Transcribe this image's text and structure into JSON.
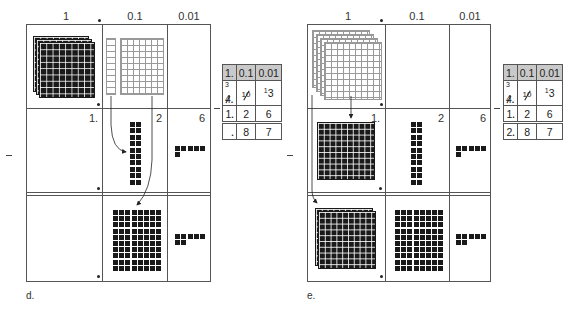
{
  "figure": {
    "type": "decimal-subtraction-base-ten-blocks",
    "column_headers": [
      "1",
      ".",
      "0.1",
      "0.01"
    ],
    "panels": [
      {
        "id": "d",
        "caption": "d.",
        "rows": [
          {
            "ones": "4 flats (3 dark stacked + regrouping)",
            "tenths": "1 rod + 10×10 outlined (regrouped)",
            "hundredths": ""
          },
          {
            "ones_label": "1.",
            "tenths_label": "2",
            "hundredths_label": "6",
            "tenths_blocks": "2×10",
            "hundredths_blocks": 6
          },
          {
            "ones_label": "",
            "tenths_blocks": "8×10",
            "hundredths_blocks": 7
          }
        ],
        "table": {
          "header": [
            "1.",
            "0.1",
            "0.01"
          ],
          "rows": [
            {
              "ones_sup": "3",
              "ones": "4",
              "ones_crossed": true,
              "dot": ".",
              "tenths_sup": "10",
              "tenths_crossed": true,
              "hundredths_sup": "1",
              "hundredths": "3"
            },
            {
              "ones": "1",
              "dot": ".",
              "tenths": "2",
              "hundredths": "6"
            },
            {
              "ones": "",
              "dot": ".",
              "tenths": "8",
              "hundredths": "7"
            }
          ]
        }
      },
      {
        "id": "e",
        "caption": "e.",
        "rows": [
          {
            "ones": "outlined flats (regrouped)",
            "tenths": "",
            "hundredths": ""
          },
          {
            "ones_label": "1.",
            "tenths_label": "2",
            "hundredths_label": "6",
            "ones_blocks": "10×10 flat",
            "tenths_blocks": "2×10",
            "hundredths_blocks": 6
          },
          {
            "ones_blocks": "2 stacked flats",
            "tenths_blocks": "8×10",
            "hundredths_blocks": 7
          }
        ],
        "table": {
          "header": [
            "1.",
            "0.1",
            "0.01"
          ],
          "rows": [
            {
              "ones_sup": "3",
              "ones": "4",
              "ones_crossed": true,
              "dot": ".",
              "tenths_sup": "10",
              "tenths_crossed": true,
              "hundredths_sup": "1",
              "hundredths": "3"
            },
            {
              "ones": "1",
              "dot": ".",
              "tenths": "2",
              "hundredths": "6"
            },
            {
              "ones": "2",
              "dot": ".",
              "tenths": "8",
              "hundredths": "7"
            }
          ]
        }
      }
    ],
    "minus_sign": "−"
  },
  "labels": {
    "d": {
      "col1": "1",
      "col2": "0.1",
      "col3": "0.01",
      "r2_ones": "1.",
      "r2_tenths": "2",
      "r2_hund": "6",
      "caption": "d."
    },
    "e": {
      "col1": "1",
      "col2": "0.1",
      "col3": "0.01",
      "r2_ones": "1.",
      "r2_tenths": "2",
      "r2_hund": "6",
      "caption": "e."
    }
  },
  "tables": {
    "d": {
      "h1": "1.",
      "h2": "0.1",
      "h3": "0.01",
      "r1_sup": "3",
      "r1_ones": "4",
      "r1_tsup": "10",
      "r1_hsup": "1",
      "r1_h": "3",
      "r2_o": "1",
      "r2_t": "2",
      "r2_h": "6",
      "r3_o": "",
      "r3_t": "8",
      "r3_h": "7"
    },
    "e": {
      "h1": "1.",
      "h2": "0.1",
      "h3": "0.01",
      "r1_sup": "3",
      "r1_ones": "4",
      "r1_tsup": "10",
      "r1_hsup": "1",
      "r1_h": "3",
      "r2_o": "1",
      "r2_t": "2",
      "r2_h": "6",
      "r3_o": "2",
      "r3_t": "8",
      "r3_h": "7"
    }
  }
}
